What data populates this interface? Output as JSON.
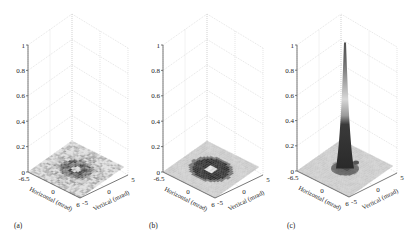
{
  "chart_data": [
    {
      "type": "surface3d",
      "panel_label": "(a)",
      "title": "",
      "xlabel": "Horizontal (mrad)",
      "ylabel": "Vertical (mrad)",
      "zlabel": "",
      "x_ticks": [
        "-6.5",
        "0",
        "6"
      ],
      "y_ticks": [
        "-5",
        "0",
        "5"
      ],
      "z_ticks": [
        "0",
        "0.2",
        "0.4",
        "0.6",
        "0.8",
        "1"
      ],
      "xlim": [
        -6.5,
        6
      ],
      "ylim": [
        -5,
        5
      ],
      "zlim": [
        0,
        1
      ],
      "grid": true,
      "description": "Flat noisy distribution with dark ring and small bright centre; peak height ≈ 0.05",
      "peak_height": 0.05,
      "profile": "noisy-flat"
    },
    {
      "type": "surface3d",
      "panel_label": "(b)",
      "title": "",
      "xlabel": "Horizontal (mrad)",
      "ylabel": "Vertical (mrad)",
      "zlabel": "",
      "x_ticks": [
        "-6.5",
        "0",
        "6"
      ],
      "y_ticks": [
        "-5",
        "0",
        "5"
      ],
      "z_ticks": [
        "0",
        "0.2",
        "0.4",
        "0.6",
        "0.8",
        "1"
      ],
      "xlim": [
        -6.5,
        6
      ],
      "ylim": [
        -5,
        5
      ],
      "zlim": [
        0,
        1
      ],
      "grid": true,
      "description": "Flat distribution with dark elliptical ring around bright centre; peak height ≈ 0.05",
      "peak_height": 0.05,
      "profile": "ring"
    },
    {
      "type": "surface3d",
      "panel_label": "(c)",
      "title": "",
      "xlabel": "Horizontal (mrad)",
      "ylabel": "Vertical (mrad)",
      "zlabel": "",
      "x_ticks": [
        "-6.5",
        "0",
        "6"
      ],
      "y_ticks": [
        "-5",
        "0",
        "5"
      ],
      "z_ticks": [
        "0",
        "0.2",
        "0.4",
        "0.6",
        "0.8",
        "1"
      ],
      "xlim": [
        -6.5,
        6
      ],
      "ylim": [
        -5,
        5
      ],
      "zlim": [
        0,
        1
      ],
      "grid": true,
      "description": "Sharp narrow central peak reaching ≈ 1.0 on a low background",
      "peak_height": 1.0,
      "profile": "sharp-peak"
    }
  ],
  "panels": [
    {
      "label": "(a)",
      "origin_x": 28,
      "zaxis_top": 45,
      "zaxis_bottom": 172,
      "base": {
        "left": [
          28,
          172
        ],
        "front": [
          80,
          198
        ],
        "right": [
          128,
          175
        ],
        "back": [
          72,
          141
        ]
      },
      "top_back": [
        72,
        14
      ],
      "label_pos": [
        14,
        228
      ]
    },
    {
      "label": "(b)",
      "origin_x": 163,
      "zaxis_top": 45,
      "zaxis_bottom": 172,
      "base": {
        "left": [
          163,
          172
        ],
        "front": [
          215,
          198
        ],
        "right": [
          263,
          175
        ],
        "back": [
          207,
          141
        ]
      },
      "top_back": [
        207,
        14
      ],
      "label_pos": [
        149,
        228
      ]
    },
    {
      "label": "(c)",
      "origin_x": 297,
      "zaxis_top": 45,
      "zaxis_bottom": 171,
      "base": {
        "left": [
          297,
          171
        ],
        "front": [
          349,
          197
        ],
        "right": [
          397,
          173
        ],
        "back": [
          341,
          140
        ]
      },
      "top_back": [
        341,
        13
      ],
      "label_pos": [
        287,
        228
      ]
    }
  ]
}
